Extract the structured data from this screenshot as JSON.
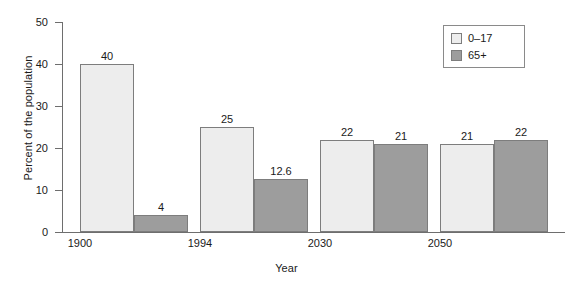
{
  "chart_data": {
    "type": "bar",
    "title": "",
    "xlabel": "Year",
    "ylabel": "Percent of the population",
    "categories": [
      "1900",
      "1994",
      "2030",
      "2050"
    ],
    "series": [
      {
        "name": "0–17",
        "color": "#ededed",
        "values": [
          40,
          25,
          22,
          21
        ],
        "labels": [
          "40",
          "25",
          "22",
          "21"
        ]
      },
      {
        "name": "65+",
        "color": "#9d9d9d",
        "values": [
          4,
          12.6,
          21,
          22
        ],
        "labels": [
          "4",
          "12.6",
          "21",
          "22"
        ]
      }
    ],
    "ylim": [
      0,
      50
    ],
    "yticks": [
      0,
      10,
      20,
      30,
      40,
      50
    ],
    "ytick_labels": [
      "0",
      "10",
      "20",
      "30",
      "40",
      "50"
    ],
    "grid": false,
    "legend_position": "top-right"
  },
  "legend": {
    "entries": [
      {
        "label": "0–17"
      },
      {
        "label": "65+"
      }
    ]
  }
}
